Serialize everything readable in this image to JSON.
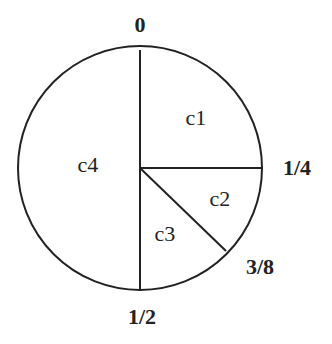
{
  "diagram": {
    "type": "circle-partition",
    "colors": {
      "stroke": "#222222",
      "background": "#ffffff"
    },
    "boundaries": [
      {
        "label": "0",
        "fraction": 0
      },
      {
        "label": "1/4",
        "fraction": 0.25
      },
      {
        "label": "3/8",
        "fraction": 0.375
      },
      {
        "label": "1/2",
        "fraction": 0.5
      }
    ],
    "regions": [
      {
        "label": "c1",
        "from": "0",
        "to": "1/4"
      },
      {
        "label": "c2",
        "from": "1/4",
        "to": "3/8"
      },
      {
        "label": "c3",
        "from": "3/8",
        "to": "1/2"
      },
      {
        "label": "c4",
        "from": "1/2",
        "to": "0"
      }
    ]
  }
}
